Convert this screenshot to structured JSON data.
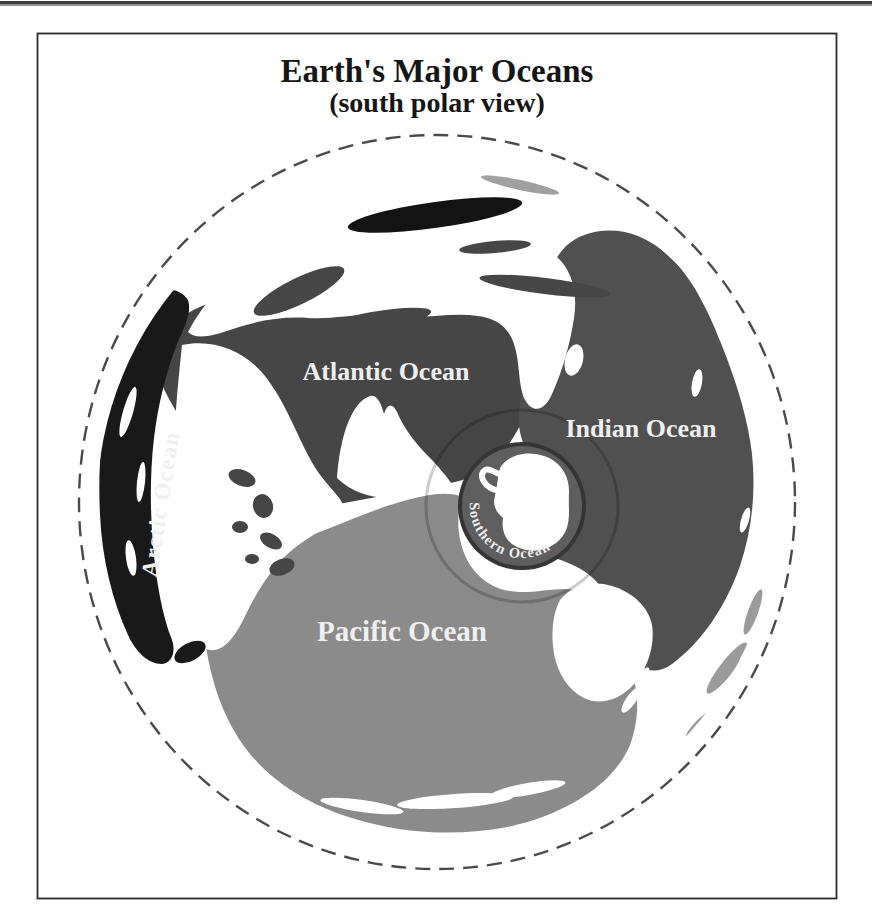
{
  "figure": {
    "title": "Earth's Major Oceans",
    "subtitle": "(south polar view)",
    "title_color": "#161616"
  },
  "map": {
    "boundary_style": "dashed",
    "boundary_color": "#4a4a4a",
    "land_color": "#ffffff",
    "label_color": "#efefef"
  },
  "oceans": {
    "arctic": {
      "label": "Arctic Ocean",
      "color": "#191919"
    },
    "atlantic": {
      "label": "Atlantic Ocean",
      "color": "#464646"
    },
    "indian": {
      "label": "Indian Ocean",
      "color": "#505050"
    },
    "pacific": {
      "label": "Pacific Ocean",
      "color": "#8b8b8b"
    },
    "southern": {
      "label": "Southern Ocean",
      "color": "#5e5e5e",
      "ring_outline": "#353535"
    }
  }
}
